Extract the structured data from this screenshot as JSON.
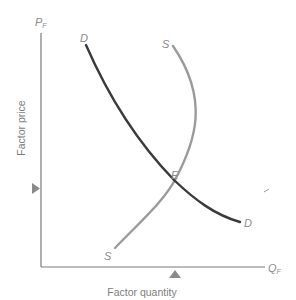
{
  "diagram": {
    "type": "factor-market-equilibrium",
    "axes": {
      "y": {
        "symbol": "P",
        "subscript": "F",
        "title": "Factor price"
      },
      "x": {
        "symbol": "Q",
        "subscript": "F",
        "title": "Factor quantity"
      }
    },
    "curves": {
      "demand": {
        "label_start": "D",
        "label_end": "D",
        "color": "#3a3a3a"
      },
      "supply": {
        "label_start": "S",
        "label_end": "S",
        "color": "#9a9a9a"
      }
    },
    "equilibrium": {
      "label": "E"
    },
    "markers": {
      "price_marker": "triangle-right",
      "quantity_marker": "triangle-up",
      "color": "#8a8a8a"
    },
    "colors": {
      "axis": "#7a7a7a",
      "text": "#8a8a8a"
    }
  }
}
